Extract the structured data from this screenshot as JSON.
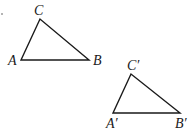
{
  "diagram": {
    "type": "geometry",
    "triangles": [
      {
        "name": "triangle-abc",
        "vertices": [
          {
            "label": "A",
            "x": 21,
            "y": 60
          },
          {
            "label": "B",
            "x": 89,
            "y": 60
          },
          {
            "label": "C",
            "x": 40,
            "y": 19
          }
        ],
        "labels": {
          "A": "A",
          "B": "B",
          "C": "C"
        }
      },
      {
        "name": "triangle-abc-prime",
        "vertices": [
          {
            "label": "A'",
            "x": 113,
            "y": 113
          },
          {
            "label": "B'",
            "x": 180,
            "y": 113
          },
          {
            "label": "C'",
            "x": 131,
            "y": 74
          }
        ],
        "labels": {
          "A": "A′",
          "B": "B′",
          "C": "C′"
        }
      }
    ],
    "stroke_color": "#1a1a1a",
    "background": "#ffffff"
  }
}
